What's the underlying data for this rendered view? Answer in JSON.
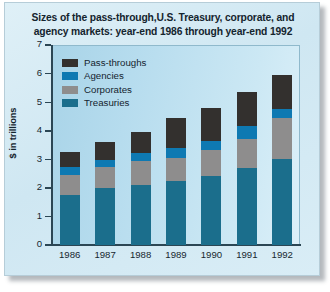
{
  "chart_data": {
    "type": "bar",
    "subtype": "stacked-bar",
    "title": "Sizes of the pass-through,U.S. Treasury, corporate, and agency markets: year-end 1986 through year-end 1992",
    "title_line1": "Sizes of the pass-through,U.S. Treasury, corporate, and",
    "title_line2": "agency markets: year-end 1986 through year-end 1992",
    "xlabel": "",
    "ylabel": "$ in trillions",
    "ylim": [
      0,
      7
    ],
    "yticks": [
      7,
      6,
      5,
      4,
      3,
      2,
      1,
      0
    ],
    "ytick_labels": [
      "7",
      "6",
      "5",
      "4",
      "3",
      "2",
      "1",
      "0"
    ],
    "grid": false,
    "legend_position": "upper-left-inside",
    "categories": [
      "1986",
      "1987",
      "1988",
      "1989",
      "1990",
      "1991",
      "1992"
    ],
    "stack_order_bottom_to_top": [
      "Treasuries",
      "Corporates",
      "Agencies",
      "Pass-throughs"
    ],
    "series": [
      {
        "name": "Pass-throughs",
        "color": "#33302e",
        "values": [
          0.52,
          0.65,
          0.72,
          1.05,
          1.15,
          1.2,
          1.2
        ]
      },
      {
        "name": "Agencies",
        "color": "#0e79b2",
        "values": [
          0.28,
          0.25,
          0.27,
          0.35,
          0.32,
          0.45,
          0.3
        ]
      },
      {
        "name": "Corporates",
        "color": "#8e8d8d",
        "values": [
          0.7,
          0.72,
          0.85,
          0.8,
          0.93,
          1.0,
          1.45
        ]
      },
      {
        "name": "Treasuries",
        "color": "#1b6e8c",
        "values": [
          1.75,
          2.0,
          2.1,
          2.25,
          2.4,
          2.7,
          3.0
        ]
      }
    ],
    "totals": [
      3.25,
      3.62,
      3.94,
      4.45,
      4.8,
      5.35,
      5.95
    ]
  },
  "legend": {
    "items": [
      {
        "label": "Pass-throughs",
        "color": "#33302e"
      },
      {
        "label": "Agencies",
        "color": "#0e79b2"
      },
      {
        "label": "Corporates",
        "color": "#8e8d8d"
      },
      {
        "label": "Treasuries",
        "color": "#1b6e8c"
      }
    ]
  },
  "colors": {
    "pass_throughs": "#33302e",
    "agencies": "#0e79b2",
    "corporates": "#8e8d8d",
    "treasuries": "#1b6e8c",
    "card_background": "#d4eaf4",
    "plot_background": "#b8dced",
    "axis": "#2b4654",
    "text": "#14242e"
  }
}
